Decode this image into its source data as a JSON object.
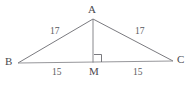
{
  "figure": {
    "kind": "isosceles-triangle-with-altitude",
    "stroke_color": "#6b6b70",
    "text_color": "#55555a",
    "background": "#ffffff",
    "vertices": {
      "A": {
        "label": "A",
        "x": 93,
        "y": 19
      },
      "B": {
        "label": "B",
        "x": 18,
        "y": 63
      },
      "C": {
        "label": "C",
        "x": 173,
        "y": 61
      },
      "M": {
        "label": "M",
        "x": 93,
        "y": 62
      }
    },
    "segments": [
      {
        "name": "side-AB",
        "from": "B",
        "to": "A",
        "length_label": "17"
      },
      {
        "name": "side-AC",
        "from": "A",
        "to": "C",
        "length_label": "17"
      },
      {
        "name": "base-BM",
        "from": "B",
        "to": "M",
        "length_label": "15"
      },
      {
        "name": "base-MC",
        "from": "M",
        "to": "C",
        "length_label": "15"
      },
      {
        "name": "altitude-AM",
        "from": "A",
        "to": "M",
        "length_label": ""
      }
    ],
    "right_angle": {
      "at": "M",
      "marker": "square",
      "size": 8,
      "side": "right"
    },
    "labels": {
      "vertex_a": "A",
      "vertex_b": "B",
      "vertex_c": "C",
      "midpoint_m": "M",
      "len_ab": "17",
      "len_ac": "17",
      "len_bm": "15",
      "len_mc": "15"
    }
  }
}
